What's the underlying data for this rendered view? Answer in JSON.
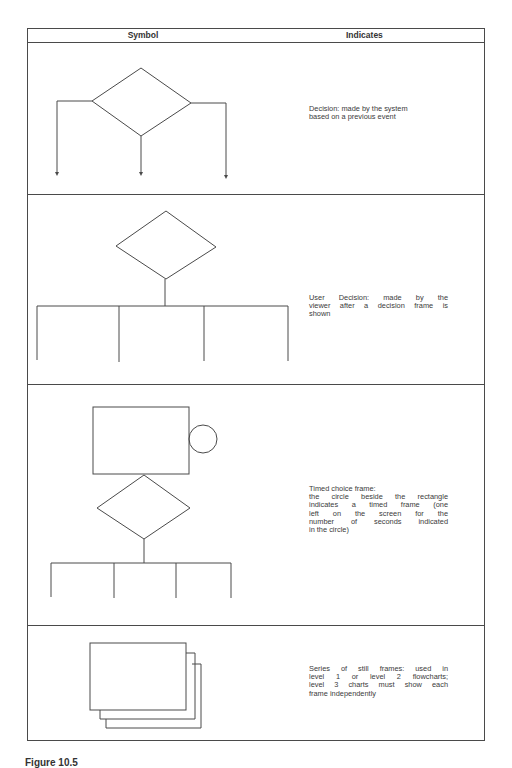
{
  "table": {
    "headers": {
      "symbol": "Symbol",
      "indicates": "Indicates"
    },
    "rows": [
      {
        "symbol": "decision-diamond-with-three-arrows",
        "indicates_lines": [
          "Decision: made by the system",
          "based on a previous event"
        ]
      },
      {
        "symbol": "user-decision-diamond-with-branches",
        "indicates_lines": [
          "User Decision: made by the",
          "viewer after a decision frame is",
          "shown"
        ]
      },
      {
        "symbol": "timed-choice-frame-rectangle-circle-diamond",
        "indicates_lines": [
          "Timed choice frame:",
          "the circle beside the rectangle",
          "indicates a timed frame (one",
          "left on the screen for the",
          "number of seconds indicated",
          "in the circle)"
        ]
      },
      {
        "symbol": "stacked-still-frames",
        "indicates_lines": [
          "Series of still frames: used in",
          "level 1 or level 2 flowcharts;",
          "level 3 charts must show each",
          "frame independently"
        ]
      }
    ]
  },
  "caption": "Figure 10.5"
}
